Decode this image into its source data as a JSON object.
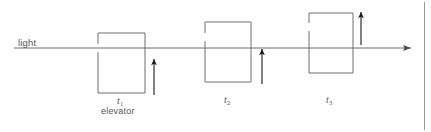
{
  "figure": {
    "canvas": {
      "width": 431,
      "height": 132,
      "background": "#ffffff"
    },
    "line_color": "#6e6e73",
    "box_color": "#6e6e73",
    "arrow_color": "#1a1a1a",
    "border_color": "#9a9a9e",
    "text_color": "#56565a",
    "light_ray": {
      "label": "light",
      "label_x": 18,
      "label_y": 38,
      "y": 48,
      "x_start": 14,
      "x_end": 413,
      "arrowhead": "right"
    },
    "caption_label": "elevator",
    "caption_x": 101,
    "caption_y": 107,
    "frames": [
      {
        "time_label": "t",
        "time_sub": "1",
        "label_x": 117,
        "label_y": 96,
        "box": {
          "x": 98,
          "y": 33,
          "width": 47,
          "height": 60
        },
        "gap": {
          "y_top": 44,
          "y_bottom": 52
        },
        "arrow": {
          "x": 154,
          "y_tail": 95,
          "y_head": 57
        }
      },
      {
        "time_label": "t",
        "time_sub": "2",
        "label_x": 224,
        "label_y": 95,
        "box": {
          "x": 205,
          "y": 22,
          "width": 46,
          "height": 60
        },
        "gap": {
          "y_top": 33,
          "y_bottom": 41
        },
        "arrow": {
          "x": 262,
          "y_tail": 84,
          "y_head": 47
        }
      },
      {
        "time_label": "t",
        "time_sub": "3",
        "label_x": 326,
        "label_y": 95,
        "box": {
          "x": 309,
          "y": 13,
          "width": 44,
          "height": 60
        },
        "gap": {
          "y_top": 23,
          "y_bottom": 31
        },
        "arrow": {
          "x": 361,
          "y_tail": 45,
          "y_head": 10
        }
      }
    ],
    "right_border": {
      "x": 424,
      "y_top": 2,
      "y_bottom": 130
    }
  }
}
